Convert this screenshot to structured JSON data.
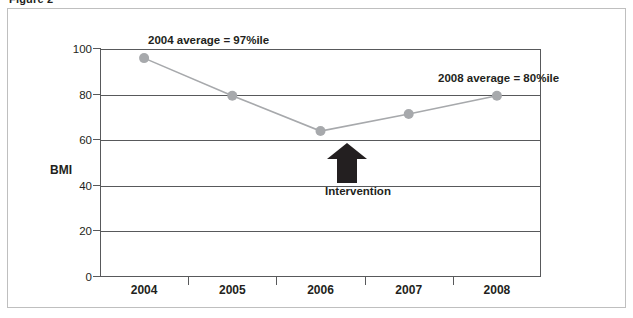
{
  "figure": {
    "caption": "Figure 2"
  },
  "chart_data": {
    "type": "line",
    "title": "",
    "xlabel": "",
    "ylabel": "BMI",
    "categories": [
      "2004",
      "2005",
      "2006",
      "2007",
      "2008"
    ],
    "values": [
      96,
      79.5,
      64,
      71.5,
      79.5
    ],
    "series": [
      {
        "name": "BMI percentile",
        "values": [
          96,
          79.5,
          64,
          71.5,
          79.5
        ]
      }
    ],
    "ylim": [
      0,
      100
    ],
    "y_ticks": [
      "100",
      "80",
      "60",
      "40",
      "20",
      "0"
    ],
    "y_tick_values": [
      100,
      80,
      60,
      40,
      20,
      0
    ],
    "grid": true,
    "legend": "none",
    "annotations": [
      {
        "name": "average-2004",
        "text": "2004 average = 97%ile"
      },
      {
        "name": "average-2008",
        "text": "2008 average = 80%ile"
      },
      {
        "name": "intervention",
        "text": "Intervention",
        "at_category": "2006"
      }
    ],
    "colors": {
      "line": "#a7a9ac",
      "marker": "#a7a9ac",
      "grid": "#58595b",
      "axis": "#58595b",
      "arrow": "#231f20",
      "text": "#231f20",
      "frame": "#bfbfbf",
      "background": "#ffffff"
    }
  }
}
